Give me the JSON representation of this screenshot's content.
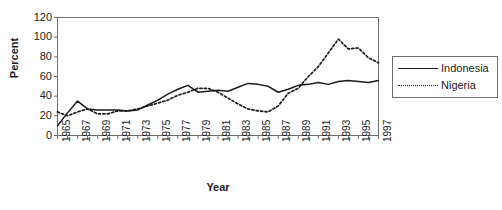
{
  "chart_data": {
    "type": "line",
    "title": "",
    "xlabel": "Year",
    "ylabel": "Percent",
    "ylim": [
      0,
      120
    ],
    "xlim": [
      1965,
      1997
    ],
    "ytick_values": [
      0,
      20,
      40,
      60,
      80,
      100,
      120
    ],
    "ytick_labels": [
      "0",
      "20",
      "40",
      "60",
      "80",
      "100",
      "120"
    ],
    "xtick_labels": [
      "1965",
      "1967",
      "1969",
      "1971",
      "1973",
      "1975",
      "1977",
      "1979",
      "1981",
      "1983",
      "1985",
      "1987",
      "1989",
      "1991",
      "1993",
      "1995",
      "1997"
    ],
    "x": [
      1965,
      1966,
      1967,
      1968,
      1969,
      1970,
      1971,
      1972,
      1973,
      1974,
      1975,
      1976,
      1977,
      1978,
      1979,
      1980,
      1981,
      1982,
      1983,
      1984,
      1985,
      1986,
      1987,
      1988,
      1989,
      1990,
      1991,
      1992,
      1993,
      1994,
      1995,
      1996,
      1997
    ],
    "grid": false,
    "legend_position": "right",
    "series": [
      {
        "name": "Indonesia",
        "style": "solid",
        "color": "#1a1a1a",
        "values": [
          10,
          23,
          35,
          27,
          26,
          26,
          26,
          25,
          26,
          31,
          36,
          42,
          47,
          51,
          44,
          45,
          46,
          45,
          49,
          53,
          52,
          50,
          44,
          47,
          51,
          52,
          54,
          52,
          55,
          56,
          55,
          54,
          56
        ]
      },
      {
        "name": "Nigeria",
        "style": "dotted",
        "color": "#1a1a1a",
        "values": [
          24,
          20,
          24,
          27,
          22,
          22,
          25,
          25,
          27,
          30,
          33,
          36,
          41,
          44,
          48,
          48,
          44,
          38,
          32,
          27,
          25,
          24,
          30,
          43,
          48,
          60,
          70,
          84,
          98,
          88,
          89,
          79,
          74
        ]
      }
    ]
  },
  "legend": {
    "entries": [
      {
        "label": "Indonesia",
        "style": "solid"
      },
      {
        "label": "Nigeria",
        "style": "dotted"
      }
    ]
  },
  "axes": {
    "y_title": "Percent",
    "x_title": "Year"
  }
}
